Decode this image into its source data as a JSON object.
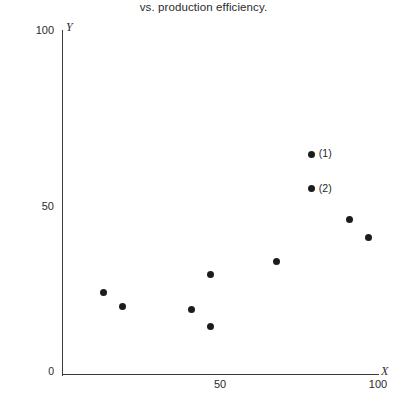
{
  "figure": {
    "caption": "vs. production efficiency."
  },
  "axes": {
    "y_name": "Y",
    "x_name": "X",
    "y_ticks": [
      "100",
      "50",
      "0"
    ],
    "x_ticks": [
      "50",
      "100"
    ]
  },
  "chart_data": {
    "type": "scatter",
    "title": "vs. production efficiency.",
    "xlabel": "X",
    "ylabel": "Y",
    "xlim": [
      0,
      100
    ],
    "ylim": [
      0,
      100
    ],
    "xticks": [
      0,
      50,
      100
    ],
    "yticks": [
      0,
      50,
      100
    ],
    "grid": false,
    "legend": "none",
    "marker": "filled-circle",
    "marker_color": "#1c1c1c",
    "points": [
      {
        "x": 13,
        "y": 24,
        "label": ""
      },
      {
        "x": 19,
        "y": 20,
        "label": ""
      },
      {
        "x": 41,
        "y": 19,
        "label": ""
      },
      {
        "x": 47,
        "y": 14,
        "label": ""
      },
      {
        "x": 47,
        "y": 29,
        "label": ""
      },
      {
        "x": 68,
        "y": 33,
        "label": ""
      },
      {
        "x": 79,
        "y": 64,
        "label": "(1)"
      },
      {
        "x": 79,
        "y": 54,
        "label": "(2)"
      },
      {
        "x": 91,
        "y": 45,
        "label": ""
      },
      {
        "x": 97,
        "y": 40,
        "label": ""
      }
    ],
    "annotations": [
      {
        "text": "(1)",
        "x": 79,
        "y": 64
      },
      {
        "text": "(2)",
        "x": 79,
        "y": 54
      }
    ]
  }
}
